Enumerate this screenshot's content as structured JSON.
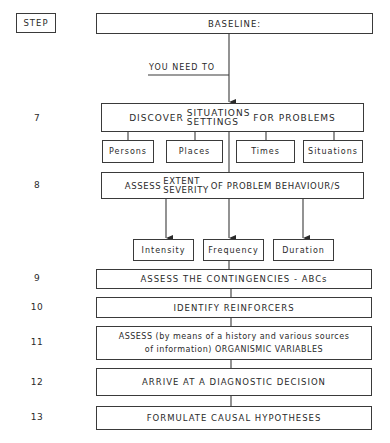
{
  "header": {
    "step_label": "STEP",
    "baseline": "BASELINE:",
    "connector_label": "YOU NEED TO"
  },
  "steps": [
    {
      "number": "7",
      "prefix": "DISCOVER",
      "stack_top": "SITUATIONS",
      "stack_bottom": "SETTINGS",
      "suffix": "FOR PROBLEMS",
      "children": [
        "Persons",
        "Places",
        "Times",
        "Situations"
      ]
    },
    {
      "number": "8",
      "prefix": "ASSESS",
      "stack_top": "EXTENT",
      "stack_bottom": "SEVERITY",
      "suffix": "OF PROBLEM BEHAVIOUR/S",
      "children": [
        "Intensity",
        "Frequency",
        "Duration"
      ]
    },
    {
      "number": "9",
      "text": "ASSESS THE CONTINGENCIES - ABCs"
    },
    {
      "number": "10",
      "text": "IDENTIFY REINFORCERS"
    },
    {
      "number": "11",
      "line1": "ASSESS (by means of a history and various sources",
      "line2": "of information) ORGANISMIC VARIABLES"
    },
    {
      "number": "12",
      "text": "ARRIVE AT A DIAGNOSTIC DECISION"
    },
    {
      "number": "13",
      "text": "FORMULATE CAUSAL HYPOTHESES"
    }
  ]
}
